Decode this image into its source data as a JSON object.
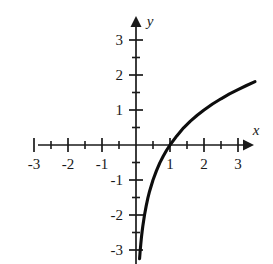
{
  "figure": {
    "background_color": "#ffffff",
    "ink_color": "#1a1a1a",
    "curve_color": "#0d0d0d"
  },
  "axes": {
    "x_axis_label": "x",
    "y_axis_label": "y",
    "x_tick_labels": [
      "-3",
      "-2",
      "-1",
      "1",
      "2",
      "3"
    ],
    "y_tick_labels": [
      "3",
      "2",
      "1",
      "-1",
      "-2",
      "-3"
    ]
  },
  "chart_data": {
    "type": "line",
    "title": "",
    "subtitle": "",
    "xlabel": "x",
    "ylabel": "y",
    "xlim": [
      -3.25,
      3.6
    ],
    "ylim": [
      -3.25,
      3.35
    ],
    "grid": false,
    "legend": null,
    "x_ticks": [
      -3,
      -2,
      -1,
      1,
      2,
      3
    ],
    "y_ticks": [
      3,
      2,
      1,
      -1,
      -2,
      -3
    ],
    "x_minor_ticks": [
      -2.5,
      -1.5,
      -0.5,
      0.5,
      1.5,
      2.5,
      3.5
    ],
    "y_minor_ticks": [
      2.5,
      1.5,
      0.5,
      -0.5,
      -1.5,
      -2.5
    ],
    "x_tick_labels": [
      "-3",
      "-2",
      "-1",
      "1",
      "2",
      "3"
    ],
    "y_tick_labels": [
      "3",
      "2",
      "1",
      "-1",
      "-2",
      "-3"
    ],
    "annotations": [],
    "series": [
      {
        "name": "y = log(x)",
        "vertical_asymptote": 0,
        "x_intercept": 1,
        "x": [
          0.105,
          0.12,
          0.14,
          0.16,
          0.18,
          0.2,
          0.25,
          0.3,
          0.35,
          0.4,
          0.5,
          0.6,
          0.7,
          0.8,
          0.9,
          1.0,
          1.2,
          1.4,
          1.6,
          1.8,
          2.0,
          2.25,
          2.5,
          2.75,
          3.0,
          3.25,
          3.5
        ],
        "y": [
          -3.25,
          -3.06,
          -2.84,
          -2.64,
          -2.47,
          -2.32,
          -2.0,
          -1.74,
          -1.51,
          -1.32,
          -1.0,
          -0.74,
          -0.51,
          -0.32,
          -0.15,
          0.0,
          0.26,
          0.49,
          0.68,
          0.85,
          1.0,
          1.17,
          1.32,
          1.46,
          1.58,
          1.7,
          1.81
        ],
        "y_display_scale": 0.33
      }
    ]
  },
  "layout": {
    "origin_x": 136,
    "origin_y": 145,
    "unit_px_x": 34,
    "unit_px_y": 35,
    "x_axis_left_px": 38,
    "x_axis_right_px": 252,
    "y_axis_top_px": 18,
    "y_axis_bottom_px": 262
  }
}
